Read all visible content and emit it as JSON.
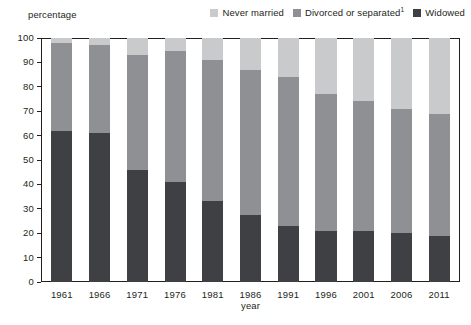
{
  "header": {
    "y_axis_caption": "percentage"
  },
  "legend": {
    "position": "top-right",
    "items": [
      {
        "label": "Never married",
        "color": "#c9cacc",
        "superscript": ""
      },
      {
        "label": "Divorced or separated",
        "color": "#8f9093",
        "superscript": "1"
      },
      {
        "label": "Widowed",
        "color": "#3f4044",
        "superscript": ""
      }
    ]
  },
  "chart_data": {
    "type": "bar",
    "subtype": "stacked-vertical-100",
    "title": "",
    "subtitle": "",
    "xlabel": "year",
    "ylabel": "percentage",
    "ylim": [
      0,
      100
    ],
    "yticks": [
      0,
      10,
      20,
      30,
      40,
      50,
      60,
      70,
      80,
      90,
      100
    ],
    "ytick_labels": [
      "0",
      "10",
      "20",
      "30",
      "40",
      "50",
      "60",
      "70",
      "80",
      "90",
      "100"
    ],
    "grid": false,
    "legend_position": "top-right",
    "categories": [
      "1961",
      "1966",
      "1971",
      "1976",
      "1981",
      "1986",
      "1991",
      "1996",
      "2001",
      "2006",
      "2011"
    ],
    "series": [
      {
        "name": "Widowed",
        "color": "#3f4044",
        "stack_order": 0,
        "values": [
          62,
          61,
          46,
          41,
          33,
          27.5,
          23,
          21,
          21,
          20,
          19
        ]
      },
      {
        "name": "Divorced or separated",
        "color": "#8f9093",
        "stack_order": 1,
        "values": [
          36,
          36,
          47,
          53.5,
          58,
          59.5,
          61,
          56,
          53,
          51,
          50
        ]
      },
      {
        "name": "Never married",
        "color": "#c9cacc",
        "stack_order": 2,
        "values": [
          2,
          3,
          7,
          5.5,
          9,
          13,
          16,
          23,
          26,
          29,
          31
        ]
      }
    ],
    "cumulative_tops": {
      "widowed": [
        62,
        61,
        46,
        41,
        33,
        27.5,
        23,
        21,
        21,
        20,
        19
      ],
      "divorced_or_separated": [
        98,
        97,
        93,
        94.5,
        91,
        87,
        84,
        77,
        74,
        71,
        69
      ],
      "never_married": [
        100,
        100,
        100,
        100,
        100,
        100,
        100,
        100,
        100,
        100,
        100
      ]
    },
    "axis_line_color": "#231f20",
    "background_color": "#ffffff"
  }
}
